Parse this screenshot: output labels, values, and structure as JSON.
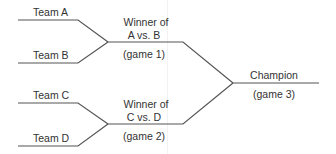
{
  "colors": {
    "line": "#555555",
    "text": "#333333",
    "background": "#ffffff"
  },
  "round1": [
    {
      "team": "Team A"
    },
    {
      "team": "Team B"
    },
    {
      "team": "Team C"
    },
    {
      "team": "Team D"
    }
  ],
  "round2": [
    {
      "line1": "Winner of",
      "line2": "A vs. B",
      "game": "(game 1)"
    },
    {
      "line1": "Winner of",
      "line2": "C vs. D",
      "game": "(game 2)"
    }
  ],
  "final": {
    "label": "Champion",
    "game": "(game 3)"
  }
}
